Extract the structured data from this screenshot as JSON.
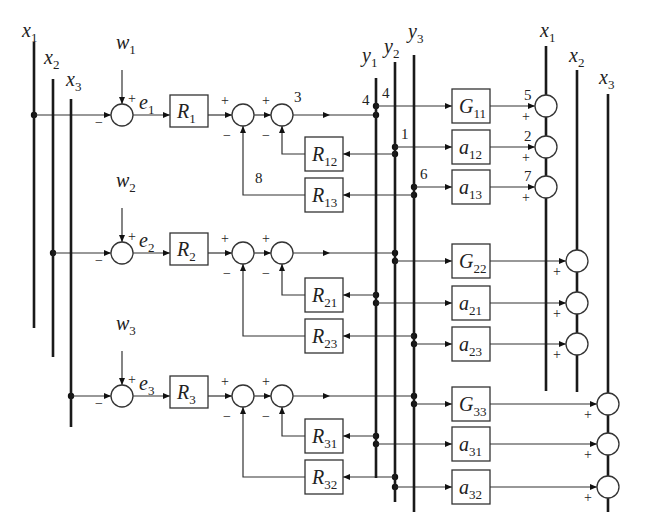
{
  "colors": {
    "line": "#333333",
    "bus": "#1a1a1a",
    "background": "#ffffff"
  },
  "buses": [
    {
      "id": "x1-left",
      "label": "x",
      "sub": "1",
      "x": 34,
      "y1": 42,
      "y2": 328,
      "lx": 22,
      "ly": 37
    },
    {
      "id": "x2-left",
      "label": "x",
      "sub": "2",
      "x": 53,
      "y1": 79,
      "y2": 357,
      "lx": 44,
      "ly": 64
    },
    {
      "id": "x3-left",
      "label": "x",
      "sub": "3",
      "x": 71,
      "y1": 99,
      "y2": 427,
      "lx": 66,
      "ly": 86
    },
    {
      "id": "y1",
      "label": "y",
      "sub": "1",
      "x": 376,
      "y1": 78,
      "y2": 478,
      "lx": 362,
      "ly": 62
    },
    {
      "id": "y2",
      "label": "y",
      "sub": "2",
      "x": 395,
      "y1": 62,
      "y2": 502,
      "lx": 384,
      "ly": 53
    },
    {
      "id": "y3",
      "label": "y",
      "sub": "3",
      "x": 414,
      "y1": 55,
      "y2": 512,
      "lx": 408,
      "ly": 38
    },
    {
      "id": "x1-right",
      "label": "x",
      "sub": "1",
      "x": 546,
      "y1": 46,
      "y2": 391,
      "lx": 540,
      "ly": 37
    },
    {
      "id": "x2-right",
      "label": "x",
      "sub": "2",
      "x": 577,
      "y1": 70,
      "y2": 392,
      "lx": 569,
      "ly": 62
    },
    {
      "id": "x3-right",
      "label": "x",
      "sub": "3",
      "x": 608,
      "y1": 94,
      "y2": 512,
      "lx": 599,
      "ly": 84
    }
  ],
  "rows": [
    {
      "id": "1",
      "y": 115,
      "input": {
        "label": "w",
        "sub": "1"
      },
      "error": {
        "label": "e",
        "sub": "1"
      },
      "tap_x": 34,
      "controller": {
        "label": "R",
        "sub": "1"
      },
      "out_bus_x": 376,
      "node_out_label": "4",
      "node_sum_label": "3",
      "node_fb_label": "8",
      "feedback": [
        {
          "label": "R",
          "sub": "12",
          "y": 154,
          "bus_x": 395
        },
        {
          "label": "R",
          "sub": "13",
          "y": 195,
          "bus_x": 414
        }
      ]
    },
    {
      "id": "2",
      "y": 253,
      "input": {
        "label": "w",
        "sub": "2"
      },
      "error": {
        "label": "e",
        "sub": "2"
      },
      "tap_x": 53,
      "controller": {
        "label": "R",
        "sub": "2"
      },
      "out_bus_x": 395,
      "node_out_label": "",
      "node_sum_label": "",
      "node_fb_label": "",
      "feedback": [
        {
          "label": "R",
          "sub": "21",
          "y": 295,
          "bus_x": 376
        },
        {
          "label": "R",
          "sub": "23",
          "y": 336,
          "bus_x": 414
        }
      ]
    },
    {
      "id": "3",
      "y": 396,
      "input": {
        "label": "w",
        "sub": "3"
      },
      "error": {
        "label": "e",
        "sub": "3"
      },
      "tap_x": 71,
      "controller": {
        "label": "R",
        "sub": "3"
      },
      "out_bus_x": 414,
      "node_out_label": "",
      "node_sum_label": "",
      "node_fb_label": "",
      "feedback": [
        {
          "label": "R",
          "sub": "31",
          "y": 436,
          "bus_x": 376
        },
        {
          "label": "R",
          "sub": "32",
          "y": 477,
          "bus_x": 395
        }
      ]
    }
  ],
  "plant": [
    {
      "label": "G",
      "sub": "11",
      "y": 106,
      "bus_x": 376,
      "out_x": 546,
      "node_label": "5",
      "tap_label": "4"
    },
    {
      "label": "a",
      "sub": "12",
      "y": 147,
      "bus_x": 395,
      "out_x": 546,
      "node_label": "2",
      "tap_label": "1"
    },
    {
      "label": "a",
      "sub": "13",
      "y": 187,
      "bus_x": 414,
      "out_x": 546,
      "node_label": "7",
      "tap_label": "6"
    },
    {
      "label": "G",
      "sub": "22",
      "y": 261,
      "bus_x": 395,
      "out_x": 577,
      "node_label": "",
      "tap_label": ""
    },
    {
      "label": "a",
      "sub": "21",
      "y": 303,
      "bus_x": 376,
      "out_x": 577,
      "node_label": "",
      "tap_label": ""
    },
    {
      "label": "a",
      "sub": "23",
      "y": 344,
      "bus_x": 414,
      "out_x": 577,
      "node_label": "",
      "tap_label": ""
    },
    {
      "label": "G",
      "sub": "33",
      "y": 404,
      "bus_x": 414,
      "out_x": 608,
      "node_label": "",
      "tap_label": ""
    },
    {
      "label": "a",
      "sub": "31",
      "y": 444,
      "bus_x": 376,
      "out_x": 608,
      "node_label": "",
      "tap_label": ""
    },
    {
      "label": "a",
      "sub": "32",
      "y": 487,
      "bus_x": 395,
      "out_x": 608,
      "node_label": "",
      "tap_label": ""
    }
  ],
  "signs": {
    "plus": "+",
    "minus": "−"
  }
}
